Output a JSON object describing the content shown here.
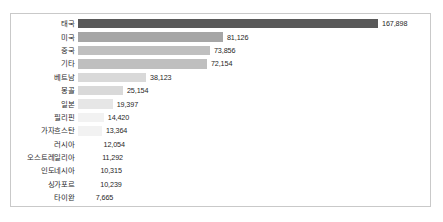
{
  "chart_data": {
    "type": "bar",
    "orientation": "horizontal",
    "title": "",
    "subtitle": "",
    "xlabel": "",
    "ylabel": "",
    "grid": false,
    "legend": false,
    "axis_visible": false,
    "value_labels_visible": true,
    "xlim": [
      0,
      167898
    ],
    "bar_max_value": 167898,
    "categories": [
      "태국",
      "미국",
      "중국",
      "기타",
      "베트남",
      "몽골",
      "일본",
      "필리핀",
      "가자흐스탄",
      "러시아",
      "오스트레일리아",
      "인도네시아",
      "싱가포르",
      "타이완"
    ],
    "values": [
      167898,
      81126,
      73856,
      72154,
      38123,
      25154,
      19397,
      14420,
      13364,
      12054,
      11292,
      10315,
      10239,
      7665
    ],
    "value_labels": [
      "167,898",
      "81,126",
      "73,856",
      "72,154",
      "38,123",
      "25,154",
      "19,397",
      "14,420",
      "13,364",
      "12,054",
      "11,292",
      "10,315",
      "10,239",
      "7,665"
    ],
    "bar_colors": [
      "#595959",
      "#a6a6a6",
      "#bfbfbf",
      "#bfbfbf",
      "#d9d9d9",
      "#d9d9d9",
      "#e6e6e6",
      "#f2f2f2",
      "#f2f2f2",
      "#ffffff",
      "#ffffff",
      "#ffffff",
      "#ffffff",
      "#ffffff"
    ],
    "frame_color": "#c9c9c9",
    "background_color": "#ffffff",
    "label_color": "#2b2b2b"
  }
}
